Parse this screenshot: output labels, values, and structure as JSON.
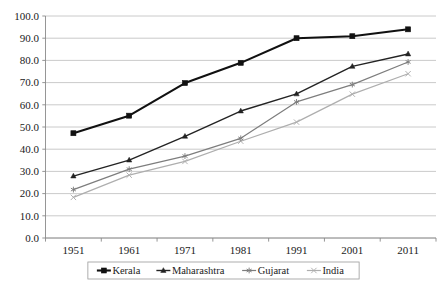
{
  "chart_data": {
    "type": "line",
    "title": "",
    "subtitle": "",
    "xlabel": "",
    "ylabel": "",
    "categories": [
      "1951",
      "1961",
      "1971",
      "1981",
      "1991",
      "2001",
      "2011"
    ],
    "x_tick_labels": [
      "1951",
      "1961",
      "1971",
      "1981",
      "1991",
      "2001",
      "2011"
    ],
    "y_tick_labels": [
      "0.0",
      "10.0",
      "20.0",
      "30.0",
      "40.0",
      "50.0",
      "60.0",
      "70.0",
      "80.0",
      "90.0",
      "100.0"
    ],
    "y_ticks": [
      0,
      10,
      20,
      30,
      40,
      50,
      60,
      70,
      80,
      90,
      100
    ],
    "ylim": [
      0,
      100
    ],
    "grid": true,
    "grid_axis": "y",
    "legend_position": "bottom",
    "series": [
      {
        "name": "Kerala",
        "marker": "square",
        "color": "#111111",
        "line_width": 2.1,
        "values": [
          47.2,
          55.1,
          69.8,
          78.9,
          90.0,
          90.9,
          94.0
        ]
      },
      {
        "name": "Maharashtra",
        "marker": "triangle",
        "color": "#232323",
        "line_width": 1.4,
        "values": [
          27.9,
          35.1,
          45.8,
          57.2,
          64.9,
          77.3,
          82.9
        ]
      },
      {
        "name": "Gujarat",
        "marker": "asterisk",
        "color": "#7d7d7d",
        "line_width": 1.2,
        "values": [
          21.8,
          31.0,
          36.9,
          44.9,
          61.3,
          69.1,
          79.3
        ]
      },
      {
        "name": "India",
        "marker": "cross",
        "color": "#aeaeae",
        "line_width": 1.2,
        "values": [
          18.3,
          28.3,
          34.5,
          43.6,
          52.2,
          64.8,
          74.0
        ]
      }
    ]
  },
  "legend": {
    "items": [
      {
        "label": "Kerala"
      },
      {
        "label": "Maharashtra"
      },
      {
        "label": "Gujarat"
      },
      {
        "label": "India"
      }
    ]
  },
  "colors": {
    "kerala": "#111111",
    "maharashtra": "#232323",
    "gujarat": "#7d7d7d",
    "india": "#aeaeae",
    "gridline": "#bdbdbd",
    "axis": "#8a8a8a",
    "text": "#1a1a1a",
    "background": "#ffffff"
  }
}
